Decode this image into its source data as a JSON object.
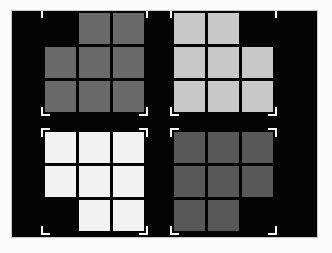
{
  "scene": {
    "name": "four-gray-block-figures",
    "canvas_background": "#fbfbfb",
    "field_background": "#040404",
    "frame_border_color": "#c9c9c9",
    "bracket_color": "#ffffff",
    "grid_rows": 3,
    "grid_cols": 3,
    "layout": "2x2",
    "cell_gap_px": 3
  },
  "figures": [
    {
      "id": "figure-top-left",
      "label": "top-left-figure",
      "fill": "#6a6a6a",
      "brightness_rank": 3,
      "missing_cell": "top-left",
      "position": {
        "left": 45,
        "top": 13
      },
      "cells": [
        [
          0,
          1,
          1
        ],
        [
          1,
          1,
          1
        ],
        [
          1,
          1,
          1
        ]
      ],
      "brackets": [
        "tl",
        "tr",
        "bl",
        "br"
      ]
    },
    {
      "id": "figure-top-right",
      "label": "top-right-figure",
      "fill": "#c8c8c8",
      "brightness_rank": 2,
      "missing_cell": "top-right",
      "position": {
        "left": 174,
        "top": 13
      },
      "cells": [
        [
          1,
          1,
          0
        ],
        [
          1,
          1,
          1
        ],
        [
          1,
          1,
          1
        ]
      ],
      "brackets": [
        "tl",
        "tr",
        "bl",
        "br"
      ]
    },
    {
      "id": "figure-bottom-left",
      "label": "bottom-left-figure",
      "fill": "#f2f2f2",
      "brightness_rank": 1,
      "missing_cell": "bottom-left",
      "position": {
        "left": 45,
        "top": 132
      },
      "cells": [
        [
          1,
          1,
          1
        ],
        [
          1,
          1,
          1
        ],
        [
          0,
          1,
          1
        ]
      ],
      "brackets": [
        "tl",
        "tr",
        "bl",
        "br"
      ]
    },
    {
      "id": "figure-bottom-right",
      "label": "bottom-right-figure",
      "fill": "#585858",
      "brightness_rank": 4,
      "missing_cell": "bottom-right",
      "position": {
        "left": 174,
        "top": 132
      },
      "cells": [
        [
          1,
          1,
          1
        ],
        [
          1,
          1,
          1
        ],
        [
          1,
          1,
          0
        ]
      ],
      "brackets": [
        "tl",
        "tr",
        "bl",
        "br"
      ]
    }
  ]
}
